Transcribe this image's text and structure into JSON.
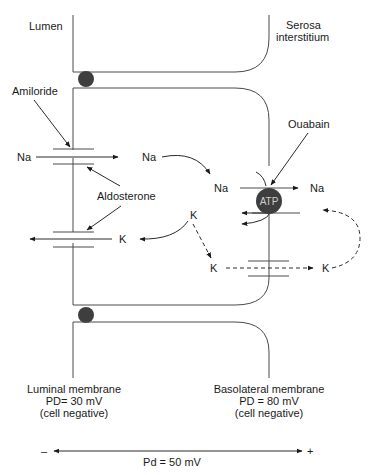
{
  "figure": {
    "compartments": {
      "lumen": "Lumen",
      "serosa_line1": "Serosa",
      "serosa_line2": "interstitium"
    },
    "drugs": {
      "amiloride": "Amiloride",
      "ouabain": "Ouabain",
      "aldosterone": "Aldosterone"
    },
    "ions": {
      "na_lumen": "Na",
      "na_cell": "Na",
      "na_cell2": "Na",
      "na_serosa": "Na",
      "k_luminal_channel": "K",
      "k_cell": "K",
      "k_cell_lower": "K",
      "k_serosa": "K"
    },
    "pump": {
      "label": "ATP",
      "color": "#3e3e3e"
    },
    "junction_color": "#3e3e3e",
    "membranes": {
      "luminal": {
        "name": "Luminal membrane",
        "pd": "PD= 30 mV",
        "note": "(cell negative)"
      },
      "basolateral": {
        "name": "Basolateral membrane",
        "pd": "PD = 80 mV",
        "note": "(cell negative)"
      }
    },
    "potential_axis": {
      "minus": "–",
      "plus": "+",
      "label": "Pd = 50 mV"
    }
  }
}
